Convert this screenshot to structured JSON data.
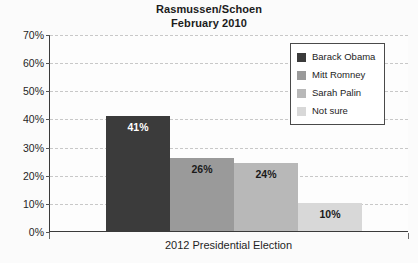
{
  "chart_data": {
    "type": "bar",
    "title": "Rasmussen/Schoen",
    "subtitle": "February 2010",
    "xlabel": "2012 Presidential Election",
    "ylabel": "",
    "ylim": [
      0,
      70
    ],
    "ytick_labels": [
      "70%",
      "60%",
      "50%",
      "40%",
      "30%",
      "20%",
      "10%",
      "0%"
    ],
    "ytick_values": [
      70,
      60,
      50,
      40,
      30,
      20,
      10,
      0
    ],
    "grid": true,
    "legend_position": "top-right",
    "categories": [
      "Barack Obama",
      "Mitt Romney",
      "Sarah Palin",
      "Not sure"
    ],
    "values": [
      41,
      26,
      24,
      10
    ],
    "value_labels": [
      "41%",
      "26%",
      "24%",
      "10%"
    ],
    "colors": [
      "#3b3b3b",
      "#9a9a9a",
      "#b8b8b8",
      "#d8d8d8"
    ],
    "value_label_colors": [
      "#ffffff",
      "#1a1a1a",
      "#1a1a1a",
      "#1a1a1a"
    ]
  },
  "legend": {
    "items": [
      {
        "label": "Barack Obama",
        "color": "#3b3b3b"
      },
      {
        "label": "Mitt Romney",
        "color": "#9a9a9a"
      },
      {
        "label": "Sarah Palin",
        "color": "#b8b8b8"
      },
      {
        "label": "Not sure",
        "color": "#d8d8d8"
      }
    ]
  }
}
